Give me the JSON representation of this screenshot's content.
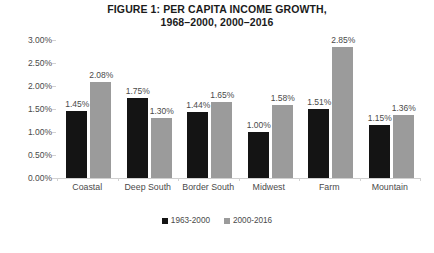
{
  "chart_data": {
    "type": "bar",
    "title": "FIGURE 1: PER CAPITA INCOME GROWTH, 1968–2000, 2000–2016",
    "title_lines": [
      "FIGURE 1: PER CAPITA INCOME GROWTH,",
      "1968–2000, 2000–2016"
    ],
    "categories": [
      "Coastal",
      "Deep South",
      "Border South",
      "Midwest",
      "Farm",
      "Mountain"
    ],
    "series": [
      {
        "name": "1963-2000",
        "color": "#141414",
        "values": [
          1.45,
          1.75,
          1.44,
          1.0,
          1.51,
          1.15
        ],
        "labels": [
          "1.45%",
          "1.75%",
          "1.44%",
          "1.00%",
          "1.51%",
          "1.15%"
        ]
      },
      {
        "name": "2000-2016",
        "color": "#9b9b9b",
        "values": [
          2.08,
          1.3,
          1.65,
          1.58,
          2.85,
          1.36
        ],
        "labels": [
          "2.08%",
          "1.30%",
          "1.65%",
          "1.58%",
          "2.85%",
          "1.36%"
        ]
      }
    ],
    "xlabel": "",
    "ylabel": "",
    "ylim": [
      0,
      3.0
    ],
    "ytick_values": [
      0.0,
      0.5,
      1.0,
      1.5,
      2.0,
      2.5,
      3.0
    ],
    "ytick_labels": [
      "0.00%",
      "0.50%",
      "1.00%",
      "1.50%",
      "2.00%",
      "2.50%",
      "3.00%"
    ],
    "grid": false,
    "legend_position": "bottom",
    "background_color": "#ffffff"
  }
}
